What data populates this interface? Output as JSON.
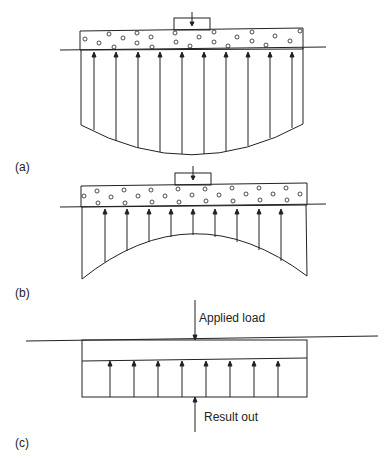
{
  "figure": {
    "panels": [
      {
        "id": "a",
        "label": "(a)",
        "description": "Flexible foundation, concave-up pressure distribution (greater at edges)"
      },
      {
        "id": "b",
        "label": "(b)",
        "description": "Pressure distribution concave-down (greater at center)"
      },
      {
        "id": "c",
        "label": "(c)",
        "description": "Uniform pressure distribution"
      }
    ],
    "annotations": {
      "applied_load": "Applied load",
      "result_out": "Result out"
    }
  }
}
